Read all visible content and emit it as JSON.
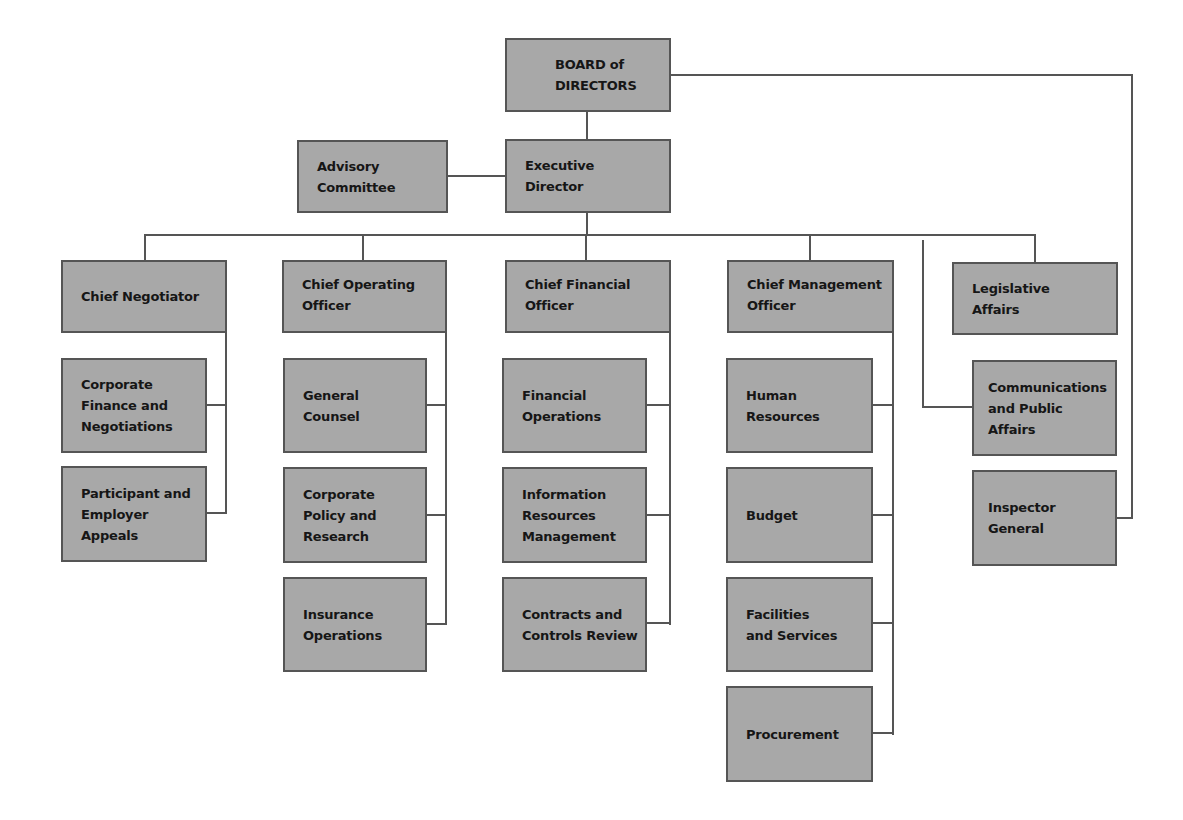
{
  "chart_title": "",
  "nodes": {
    "board": "BOARD of\nDIRECTORS",
    "executive_director": "Executive\nDirector",
    "advisory_committee": "Advisory\nCommittee",
    "chief_negotiator": "Chief Negotiator",
    "corporate_finance": "Corporate\nFinance and\nNegotiations",
    "participant_appeals": "Participant and\nEmployer\nAppeals",
    "coo": "Chief Operating\nOfficer",
    "general_counsel": "General\nCounsel",
    "corporate_policy": "Corporate\nPolicy and\nResearch",
    "insurance_operations": "Insurance\nOperations",
    "cfo": "Chief Financial\nOfficer",
    "financial_operations": "Financial\nOperations",
    "info_resources": "Information\nResources\nManagement",
    "contracts_review": "Contracts and\nControls Review",
    "cmo": "Chief Management\nOfficer",
    "human_resources": "Human\nResources",
    "budget": "Budget",
    "facilities": "Facilities\nand Services",
    "procurement": "Procurement",
    "legislative_affairs": "Legislative\nAffairs",
    "communications": "Communications\nand Public\nAffairs",
    "inspector_general": "Inspector\nGeneral"
  },
  "hierarchy": {
    "BOARD of DIRECTORS": [
      "Executive Director",
      "Inspector General"
    ],
    "Executive Director": [
      "Advisory Committee",
      "Chief Negotiator",
      "Chief Operating Officer",
      "Chief Financial Officer",
      "Chief Management Officer",
      "Legislative Affairs",
      "Communications and Public Affairs"
    ],
    "Chief Negotiator": [
      "Corporate Finance and Negotiations",
      "Participant and Employer Appeals"
    ],
    "Chief Operating Officer": [
      "General Counsel",
      "Corporate Policy and Research",
      "Insurance Operations"
    ],
    "Chief Financial Officer": [
      "Financial Operations",
      "Information Resources Management",
      "Contracts and Controls Review"
    ],
    "Chief Management Officer": [
      "Human Resources",
      "Budget",
      "Facilities and Services",
      "Procurement"
    ]
  },
  "colors": {
    "box_fill": "#a8a8a8",
    "box_border": "#555555",
    "line": "#555555",
    "text": "#161616"
  }
}
